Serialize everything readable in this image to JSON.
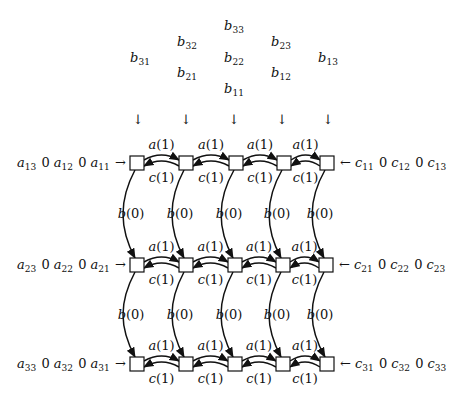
{
  "figure": {
    "type": "systolic-array-diagram",
    "rows": 3,
    "cols": 5
  },
  "b_inputs": [
    {
      "name": "b",
      "sub": "33",
      "x": 234,
      "y": 30
    },
    {
      "name": "b",
      "sub": "32",
      "x": 187,
      "y": 46
    },
    {
      "name": "b",
      "sub": "23",
      "x": 281,
      "y": 46
    },
    {
      "name": "b",
      "sub": "31",
      "x": 140,
      "y": 62
    },
    {
      "name": "b",
      "sub": "22",
      "x": 234,
      "y": 62
    },
    {
      "name": "b",
      "sub": "13",
      "x": 328,
      "y": 62
    },
    {
      "name": "b",
      "sub": "21",
      "x": 187,
      "y": 77
    },
    {
      "name": "b",
      "sub": "12",
      "x": 281,
      "y": 77
    },
    {
      "name": "b",
      "sub": "11",
      "x": 234,
      "y": 93
    }
  ],
  "down_arrows_x": [
    138,
    186,
    234,
    282,
    328
  ],
  "down_arrow_glyph": "↓",
  "rows": [
    {
      "y": 163,
      "cells_x": [
        137,
        186,
        236,
        284,
        327
      ],
      "left_input": {
        "terms": [
          [
            "a",
            "13"
          ],
          [
            "0",
            ""
          ],
          [
            "a",
            "12"
          ],
          [
            "0",
            ""
          ],
          [
            "a",
            "11"
          ]
        ],
        "arrow": "→"
      },
      "right_input": {
        "arrow": "←",
        "terms": [
          [
            "c",
            "11"
          ],
          [
            "0",
            ""
          ],
          [
            "c",
            "12"
          ],
          [
            "0",
            ""
          ],
          [
            "c",
            "13"
          ]
        ]
      }
    },
    {
      "y": 265,
      "cells_x": [
        137,
        186,
        235,
        283,
        326
      ],
      "left_input": {
        "terms": [
          [
            "a",
            "23"
          ],
          [
            "0",
            ""
          ],
          [
            "a",
            "22"
          ],
          [
            "0",
            ""
          ],
          [
            "a",
            "21"
          ]
        ],
        "arrow": "→"
      },
      "right_input": {
        "arrow": "←",
        "terms": [
          [
            "c",
            "21"
          ],
          [
            "0",
            ""
          ],
          [
            "c",
            "22"
          ],
          [
            "0",
            ""
          ],
          [
            "c",
            "23"
          ]
        ]
      }
    },
    {
      "y": 364,
      "cells_x": [
        137,
        186,
        235,
        283,
        327
      ],
      "left_input": {
        "terms": [
          [
            "a",
            "33"
          ],
          [
            "0",
            ""
          ],
          [
            "a",
            "32"
          ],
          [
            "0",
            ""
          ],
          [
            "a",
            "31"
          ]
        ],
        "arrow": "→"
      },
      "right_input": {
        "arrow": "←",
        "terms": [
          [
            "c",
            "31"
          ],
          [
            "0",
            ""
          ],
          [
            "c",
            "32"
          ],
          [
            "0",
            ""
          ],
          [
            "c",
            "33"
          ]
        ]
      }
    }
  ],
  "edge_labels": {
    "forward": "a(1)",
    "backward": "c(1)",
    "vertical": "b(0)"
  }
}
